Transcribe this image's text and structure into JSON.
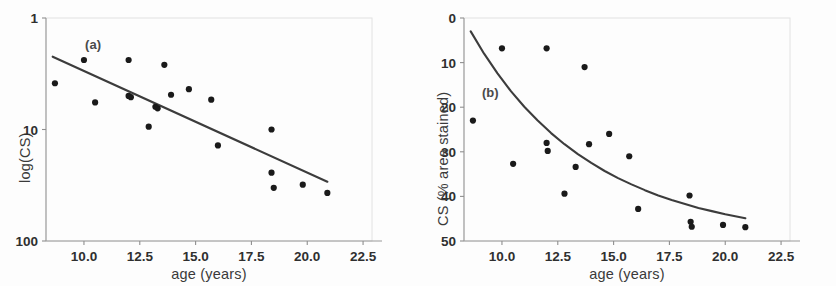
{
  "figure": {
    "width": 836,
    "height": 286,
    "background": "#fdfdfd",
    "ink_color": "#2b2b2b",
    "marker_color": "#1a1a1a",
    "line_color": "#3c3c3c"
  },
  "panels": [
    {
      "tag": "(a)",
      "xlabel": "age (years)",
      "ylabel": "log(CS)",
      "xticks": [
        "10.0",
        "12.5",
        "15.0",
        "17.5",
        "20.0",
        "22.5"
      ],
      "yticks": [
        "100",
        "10",
        "1"
      ]
    },
    {
      "tag": "(b)",
      "xlabel": "age (years)",
      "ylabel": "CS (% area stained)",
      "xticks": [
        "10.0",
        "12.5",
        "15.0",
        "17.5",
        "20.0",
        "22.5"
      ],
      "yticks": [
        "50",
        "40",
        "30",
        "20",
        "10",
        "0"
      ]
    }
  ],
  "chart_data": [
    {
      "type": "scatter",
      "panel": "(a)",
      "title": "",
      "xlabel": "age (years)",
      "ylabel": "log(CS)",
      "xlim": [
        8.3,
        22.9
      ],
      "xticks": [
        10.0,
        12.5,
        15.0,
        17.5,
        20.0,
        22.5
      ],
      "ylim": [
        1,
        100
      ],
      "yscale": "log",
      "yticks": [
        1,
        10,
        100
      ],
      "grid": false,
      "legend": null,
      "series": [
        {
          "name": "CS vs age (log scale)",
          "marker": "filled-circle",
          "x": [
            8.7,
            10.0,
            10.5,
            12.0,
            12.0,
            12.1,
            12.9,
            13.2,
            13.3,
            13.6,
            13.9,
            14.7,
            15.7,
            16.0,
            18.4,
            18.4,
            18.5,
            19.8,
            20.9
          ],
          "y": [
            26.0,
            42.0,
            17.5,
            42.0,
            20.0,
            19.5,
            10.6,
            16.0,
            15.5,
            38.0,
            20.5,
            23.0,
            18.5,
            7.2,
            10.0,
            4.1,
            3.0,
            3.2,
            2.7
          ]
        }
      ],
      "fit_line": {
        "name": "linear fit on log(CS)",
        "x": [
          8.6,
          20.9
        ],
        "y": [
          45.0,
          3.4
        ],
        "style": "solid"
      },
      "annotations": [
        {
          "text": "(a)",
          "x": 10.05,
          "y": 58.0
        }
      ]
    },
    {
      "type": "scatter",
      "panel": "(b)",
      "title": "",
      "xlabel": "age (years)",
      "ylabel": "CS (% area stained)",
      "xlim": [
        8.3,
        22.9
      ],
      "xticks": [
        10.0,
        12.5,
        15.0,
        17.5,
        20.0,
        22.5
      ],
      "ylim": [
        0,
        50
      ],
      "yscale": "linear",
      "yticks": [
        0,
        10,
        20,
        30,
        40,
        50
      ],
      "grid": false,
      "legend": null,
      "series": [
        {
          "name": "CS vs age",
          "marker": "filled-circle",
          "x": [
            8.7,
            10.0,
            10.5,
            12.0,
            12.0,
            12.05,
            12.8,
            13.3,
            13.7,
            13.9,
            14.8,
            15.7,
            16.1,
            18.4,
            18.45,
            18.5,
            19.9,
            20.9
          ],
          "y": [
            27.0,
            43.2,
            17.3,
            43.2,
            22.0,
            20.2,
            10.6,
            16.6,
            39.0,
            21.7,
            24.0,
            19.0,
            7.2,
            10.2,
            4.3,
            3.2,
            3.6,
            3.1
          ]
        }
      ],
      "fit_line": {
        "name": "exponential decay fit",
        "style": "solid",
        "x": [
          8.6,
          9.2,
          9.8,
          10.4,
          11.0,
          11.6,
          12.2,
          12.8,
          13.4,
          14.0,
          14.6,
          15.2,
          15.8,
          16.4,
          17.0,
          17.6,
          18.2,
          18.8,
          19.4,
          20.0,
          20.9
        ],
        "y": [
          47.0,
          42.0,
          37.6,
          33.6,
          30.1,
          27.0,
          24.2,
          21.7,
          19.5,
          17.5,
          15.7,
          14.1,
          12.7,
          11.4,
          10.2,
          9.2,
          8.3,
          7.4,
          6.7,
          6.0,
          5.1
        ]
      },
      "annotations": [
        {
          "text": "(b)",
          "x": 9.1,
          "y": 33.5
        }
      ]
    }
  ]
}
